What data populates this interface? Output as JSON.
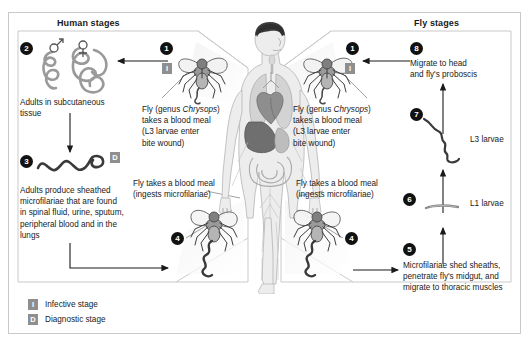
{
  "diagram": {
    "title_human": "Human stages",
    "title_fly": "Fly stages",
    "accent_badge_color": "#111111",
    "marker_color": "#8f8f8f",
    "frame_color": "#c9c9c9"
  },
  "steps": {
    "s1_left": {
      "number": "1",
      "marker": "i",
      "text": "Fly (genus Chrysops)\ntakes a blood meal\n(L3 larvae enter\nbite wound)"
    },
    "s1_right": {
      "number": "1",
      "marker": "i",
      "text": "Fly (genus Chrysops)\ntakes a blood meal\n(L3 larvae enter\nbite wound)"
    },
    "s2": {
      "number": "2",
      "text": "Adults in subcutaneous\ntissue",
      "male_symbol": "♂",
      "female_symbol": "♀"
    },
    "s3": {
      "number": "3",
      "marker": "d",
      "text": "Adults produce sheathed\nmicrofilariae that are found\nin spinal fluid, urine, sputum,\nperipheral blood and in the\nlungs"
    },
    "s4_left": {
      "number": "4",
      "text": "Fly takes a blood meal\n(ingests microfilariae)"
    },
    "s4_right": {
      "number": "4",
      "text": "Fly takes a blood meal\n(ingests microfilariae)"
    },
    "s5": {
      "number": "5",
      "text": "Microfilariae shed sheaths,\npenetrate fly's midgut, and\nmigrate to thoracic muscles"
    },
    "s6": {
      "number": "6",
      "label": "L1 larvae"
    },
    "s7": {
      "number": "7",
      "label": "L3 larvae"
    },
    "s8": {
      "number": "8",
      "text": "Migrate to head\nand fly's proboscis"
    }
  },
  "legend": {
    "items": [
      {
        "key": "I",
        "label": "Infective stage"
      },
      {
        "key": "D",
        "label": "Diagnostic stage"
      }
    ]
  },
  "markers": {
    "infective": "I",
    "diagnostic": "D"
  }
}
